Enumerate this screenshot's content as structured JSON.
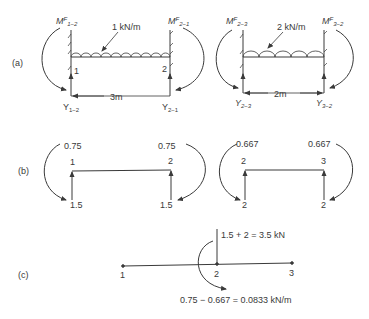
{
  "panels": {
    "a": {
      "label": "(a)",
      "left": {
        "load": "1 kN/m",
        "span": "3m",
        "node_left": "1",
        "node_right": "2",
        "moment_left": {
          "base": "M",
          "sup": "F",
          "sub": "1−2"
        },
        "moment_right": {
          "base": "M",
          "sup": "F",
          "sub": "2−1"
        },
        "reaction_left": {
          "base": "Y",
          "sub": "1−2"
        },
        "reaction_right": {
          "base": "Y",
          "sub": "2−1"
        }
      },
      "right": {
        "load": "2 kN/m",
        "span": "2m",
        "moment_left": {
          "base": "M",
          "sup": "F",
          "sub": "2−3"
        },
        "moment_right": {
          "base": "M",
          "sup": "F",
          "sub": "3−2"
        },
        "reaction_left": {
          "base": "Y",
          "sub": "2−3"
        },
        "reaction_right": {
          "base": "Y",
          "sub": "3−2"
        }
      }
    },
    "b": {
      "label": "(b)",
      "left": {
        "node_left": "1",
        "node_right": "2",
        "moment_left": "0.75",
        "moment_right": "0.75",
        "reaction_left": "1.5",
        "reaction_right": "1.5"
      },
      "right": {
        "node_left": "2",
        "node_right": "3",
        "moment_left": "0.667",
        "moment_right": "0.667",
        "reaction_left": "2",
        "reaction_right": "2"
      }
    },
    "c": {
      "label": "(c)",
      "nodes": [
        "1",
        "2",
        "3"
      ],
      "force_text": "1.5 + 2 = 3.5 kN",
      "moment_text": "0.75 − 0.667 = 0.0833 kN/m"
    }
  },
  "colors": {
    "ink": "#3a3a3a",
    "background": "#ffffff"
  }
}
